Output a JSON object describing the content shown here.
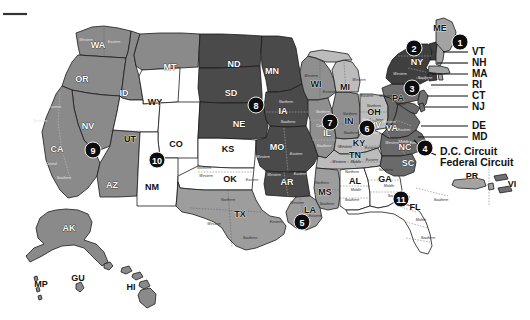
{
  "figure": {
    "type": "choropleth-map"
  },
  "circuits": [
    {
      "number": "1",
      "badge": {
        "x": 460,
        "y": 42
      },
      "fill": "#a3a3a3",
      "states": [
        "ME",
        "NH",
        "MA",
        "RI",
        "PR"
      ]
    },
    {
      "number": "2",
      "badge": {
        "x": 414,
        "y": 48
      },
      "fill": "#3f3f3f",
      "states": [
        "NY",
        "VT",
        "CT"
      ]
    },
    {
      "number": "3",
      "badge": {
        "x": 412,
        "y": 88
      },
      "fill": "#707070",
      "states": [
        "PA",
        "NJ",
        "DE",
        "VI"
      ]
    },
    {
      "number": "4",
      "badge": {
        "x": 425,
        "y": 148
      },
      "fill": "#6a6a6a",
      "states": [
        "MD",
        "VA",
        "WV",
        "NC",
        "SC"
      ]
    },
    {
      "number": "5",
      "badge": {
        "x": 302,
        "y": 222
      },
      "fill": "#9d9d9d",
      "states": [
        "TX",
        "LA",
        "MS"
      ]
    },
    {
      "number": "6",
      "badge": {
        "x": 367,
        "y": 128
      },
      "fill": "#bcbcbc",
      "states": [
        "MI",
        "OH",
        "KY",
        "TN"
      ]
    },
    {
      "number": "7",
      "badge": {
        "x": 330,
        "y": 122
      },
      "fill": "#8f8f8f",
      "states": [
        "WI",
        "IL",
        "IN"
      ]
    },
    {
      "number": "8",
      "badge": {
        "x": 256,
        "y": 105
      },
      "fill": "#4a4a4a",
      "states": [
        "ND",
        "SD",
        "NE",
        "MN",
        "IA",
        "MO",
        "AR"
      ]
    },
    {
      "number": "9",
      "badge": {
        "x": 93,
        "y": 150
      },
      "fill": "#8a8a8a",
      "states": [
        "CA",
        "NV",
        "OR",
        "WA",
        "ID",
        "MT",
        "AZ",
        "AK",
        "HI",
        "GU",
        "MP"
      ]
    },
    {
      "number": "10",
      "badge": {
        "x": 157,
        "y": 160
      },
      "fill": "#ffffff",
      "states": [
        "CO",
        "KS",
        "NM",
        "OK",
        "UT",
        "WY"
      ]
    },
    {
      "number": "11",
      "badge": {
        "x": 401,
        "y": 199
      },
      "fill": "#ffffff",
      "states": [
        "AL",
        "GA",
        "FL"
      ]
    }
  ],
  "state_labels": [
    {
      "abbr": "WA",
      "x": 98,
      "y": 46,
      "tone": "ondark"
    },
    {
      "abbr": "OR",
      "x": 82,
      "y": 80,
      "tone": "ondark"
    },
    {
      "abbr": "ID",
      "x": 124,
      "y": 94,
      "tone": "ondark"
    },
    {
      "abbr": "MT",
      "x": 170,
      "y": 68,
      "tone": "ondark"
    },
    {
      "abbr": "ND",
      "x": 234,
      "y": 65,
      "tone": "ondark"
    },
    {
      "abbr": "SD",
      "x": 231,
      "y": 94,
      "tone": "ondark"
    },
    {
      "abbr": "NE",
      "x": 239,
      "y": 125,
      "tone": "ondark"
    },
    {
      "abbr": "MN",
      "x": 272,
      "y": 72,
      "tone": "ondark"
    },
    {
      "abbr": "IA",
      "x": 283,
      "y": 112,
      "tone": "ondark"
    },
    {
      "abbr": "MO",
      "x": 277,
      "y": 148,
      "tone": "ondark"
    },
    {
      "abbr": "AR",
      "x": 287,
      "y": 183,
      "tone": "ondark"
    },
    {
      "abbr": "WY",
      "x": 155,
      "y": 103,
      "tone": "onlight"
    },
    {
      "abbr": "UT",
      "x": 130,
      "y": 140,
      "tone": "onlight"
    },
    {
      "abbr": "CO",
      "x": 176,
      "y": 145,
      "tone": "onlight"
    },
    {
      "abbr": "KS",
      "x": 228,
      "y": 150,
      "tone": "onlight"
    },
    {
      "abbr": "OK",
      "x": 230,
      "y": 180,
      "tone": "onlight"
    },
    {
      "abbr": "NM",
      "x": 152,
      "y": 188,
      "tone": "onlight"
    },
    {
      "abbr": "AZ",
      "x": 112,
      "y": 186,
      "tone": "ondark"
    },
    {
      "abbr": "NV",
      "x": 88,
      "y": 127,
      "tone": "ondark"
    },
    {
      "abbr": "CA",
      "x": 57,
      "y": 150,
      "tone": "ondark"
    },
    {
      "abbr": "TX",
      "x": 240,
      "y": 215,
      "tone": "onlight"
    },
    {
      "abbr": "LA",
      "x": 310,
      "y": 211,
      "tone": "onlight"
    },
    {
      "abbr": "MS",
      "x": 325,
      "y": 193,
      "tone": "onlight"
    },
    {
      "abbr": "AL",
      "x": 355,
      "y": 182,
      "tone": "onlight"
    },
    {
      "abbr": "GA",
      "x": 385,
      "y": 180,
      "tone": "onlight"
    },
    {
      "abbr": "FL",
      "x": 415,
      "y": 208,
      "tone": "onlight"
    },
    {
      "abbr": "SC",
      "x": 408,
      "y": 164,
      "tone": "ondark"
    },
    {
      "abbr": "NC",
      "x": 405,
      "y": 148,
      "tone": "ondark"
    },
    {
      "abbr": "VA",
      "x": 392,
      "y": 129,
      "tone": "ondark"
    },
    {
      "abbr": "WV",
      "x": 374,
      "y": 126,
      "tone": "ondark"
    },
    {
      "abbr": "TN",
      "x": 355,
      "y": 156,
      "tone": "onlight"
    },
    {
      "abbr": "KY",
      "x": 359,
      "y": 144,
      "tone": "onlight"
    },
    {
      "abbr": "OH",
      "x": 374,
      "y": 113,
      "tone": "onlight"
    },
    {
      "abbr": "IN",
      "x": 349,
      "y": 122,
      "tone": "onlight"
    },
    {
      "abbr": "IL",
      "x": 327,
      "y": 134,
      "tone": "ondark"
    },
    {
      "abbr": "MI",
      "x": 345,
      "y": 88,
      "tone": "onlight"
    },
    {
      "abbr": "WI",
      "x": 316,
      "y": 85,
      "tone": "onlight"
    },
    {
      "abbr": "PA",
      "x": 398,
      "y": 99,
      "tone": "onlight"
    },
    {
      "abbr": "NY",
      "x": 417,
      "y": 63,
      "tone": "ondark"
    },
    {
      "abbr": "ME",
      "x": 440,
      "y": 29,
      "tone": "onlight"
    },
    {
      "abbr": "AK",
      "x": 69,
      "y": 229,
      "tone": "ondark"
    },
    {
      "abbr": "HI",
      "x": 131,
      "y": 288,
      "tone": "onlight"
    },
    {
      "abbr": "GU",
      "x": 78,
      "y": 279,
      "tone": "onlight"
    },
    {
      "abbr": "MP",
      "x": 41,
      "y": 285,
      "tone": "onlight"
    },
    {
      "abbr": "PR",
      "x": 472,
      "y": 177,
      "tone": "onlight"
    },
    {
      "abbr": "VI",
      "x": 512,
      "y": 185,
      "tone": "onlight"
    }
  ],
  "side_labels": [
    {
      "text": "VT",
      "x": 472,
      "y": 52,
      "leader_to_x": 443,
      "leader_to_y": 52
    },
    {
      "text": "NH",
      "x": 472,
      "y": 63,
      "leader_to_x": 437,
      "leader_to_y": 63
    },
    {
      "text": "MA",
      "x": 472,
      "y": 74,
      "leader_to_x": 432,
      "leader_to_y": 74
    },
    {
      "text": "RI",
      "x": 472,
      "y": 85,
      "leader_to_x": 431,
      "leader_to_y": 85
    },
    {
      "text": "CT",
      "x": 472,
      "y": 96,
      "leader_to_x": 427,
      "leader_to_y": 96
    },
    {
      "text": "NJ",
      "x": 472,
      "y": 107,
      "leader_to_x": 424,
      "leader_to_y": 107
    },
    {
      "text": "DE",
      "x": 472,
      "y": 126,
      "leader_to_x": 421,
      "leader_to_y": 126
    },
    {
      "text": "MD",
      "x": 472,
      "y": 137,
      "leader_to_x": 418,
      "leader_to_y": 137
    }
  ],
  "circuit_labels": [
    {
      "text": "D.C. Circuit",
      "x": 440,
      "y": 152
    },
    {
      "text": "Federal Circuit",
      "x": 440,
      "y": 163
    }
  ],
  "district_labels": [
    {
      "text": "Western",
      "x": 86,
      "y": 40,
      "tone": "ondark"
    },
    {
      "text": "Eastern",
      "x": 114,
      "y": 42,
      "tone": "ondark"
    },
    {
      "text": "Eastern",
      "x": 55,
      "y": 107,
      "tone": "ondark"
    },
    {
      "text": "Northern",
      "x": 40,
      "y": 121,
      "tone": "ondark"
    },
    {
      "text": "Central",
      "x": 51,
      "y": 164,
      "tone": "ondark"
    },
    {
      "text": "Southern",
      "x": 64,
      "y": 178,
      "tone": "ondark"
    },
    {
      "text": "Northern",
      "x": 286,
      "y": 102,
      "tone": "ondark"
    },
    {
      "text": "Southern",
      "x": 288,
      "y": 122,
      "tone": "ondark"
    },
    {
      "text": "Western",
      "x": 263,
      "y": 157,
      "tone": "ondark"
    },
    {
      "text": "Eastern",
      "x": 296,
      "y": 154,
      "tone": "ondark"
    },
    {
      "text": "Western",
      "x": 274,
      "y": 175,
      "tone": "ondark"
    },
    {
      "text": "Eastern",
      "x": 300,
      "y": 174,
      "tone": "ondark"
    },
    {
      "text": "Northern",
      "x": 204,
      "y": 168,
      "tone": "onlight"
    },
    {
      "text": "Western",
      "x": 206,
      "y": 176,
      "tone": "onlight"
    },
    {
      "text": "Eastern",
      "x": 252,
      "y": 180,
      "tone": "onlight"
    },
    {
      "text": "Northern",
      "x": 228,
      "y": 200,
      "tone": "onlight"
    },
    {
      "text": "Western",
      "x": 214,
      "y": 224,
      "tone": "onlight"
    },
    {
      "text": "Eastern",
      "x": 276,
      "y": 222,
      "tone": "onlight"
    },
    {
      "text": "Southern",
      "x": 250,
      "y": 238,
      "tone": "onlight"
    },
    {
      "text": "Western",
      "x": 297,
      "y": 203,
      "tone": "onlight"
    },
    {
      "text": "Eastern",
      "x": 315,
      "y": 216,
      "tone": "onlight"
    },
    {
      "text": "Northern",
      "x": 322,
      "y": 183,
      "tone": "onlight"
    },
    {
      "text": "Southern",
      "x": 327,
      "y": 204,
      "tone": "onlight"
    },
    {
      "text": "Northern",
      "x": 352,
      "y": 172,
      "tone": "onlight"
    },
    {
      "text": "Middle",
      "x": 356,
      "y": 190,
      "tone": "onlight"
    },
    {
      "text": "Southern",
      "x": 352,
      "y": 200,
      "tone": "onlight"
    },
    {
      "text": "Northern",
      "x": 386,
      "y": 170,
      "tone": "onlight"
    },
    {
      "text": "Middle",
      "x": 389,
      "y": 186,
      "tone": "onlight"
    },
    {
      "text": "Southern",
      "x": 395,
      "y": 196,
      "tone": "onlight"
    },
    {
      "text": "Northern",
      "x": 403,
      "y": 197,
      "tone": "onlight"
    },
    {
      "text": "Middle",
      "x": 421,
      "y": 220,
      "tone": "onlight"
    },
    {
      "text": "Southern",
      "x": 428,
      "y": 238,
      "tone": "onlight"
    },
    {
      "text": "Western",
      "x": 311,
      "y": 76,
      "tone": "onlight"
    },
    {
      "text": "Eastern",
      "x": 329,
      "y": 92,
      "tone": "onlight"
    },
    {
      "text": "Western",
      "x": 359,
      "y": 80,
      "tone": "onlight"
    },
    {
      "text": "Eastern",
      "x": 367,
      "y": 96,
      "tone": "onlight"
    },
    {
      "text": "Northern",
      "x": 323,
      "y": 112,
      "tone": "ondark"
    },
    {
      "text": "Central",
      "x": 322,
      "y": 126,
      "tone": "ondark"
    },
    {
      "text": "Southern",
      "x": 324,
      "y": 146,
      "tone": "ondark"
    },
    {
      "text": "Northern",
      "x": 350,
      "y": 114,
      "tone": "onlight"
    },
    {
      "text": "Southern",
      "x": 351,
      "y": 133,
      "tone": "onlight"
    },
    {
      "text": "Northern",
      "x": 374,
      "y": 106,
      "tone": "onlight"
    },
    {
      "text": "Southern",
      "x": 376,
      "y": 120,
      "tone": "onlight"
    },
    {
      "text": "Western",
      "x": 345,
      "y": 147,
      "tone": "onlight"
    },
    {
      "text": "Eastern",
      "x": 371,
      "y": 148,
      "tone": "onlight"
    },
    {
      "text": "Western",
      "x": 339,
      "y": 162,
      "tone": "onlight"
    },
    {
      "text": "Middle",
      "x": 356,
      "y": 162,
      "tone": "onlight"
    },
    {
      "text": "Eastern",
      "x": 372,
      "y": 160,
      "tone": "onlight"
    },
    {
      "text": "Northern",
      "x": 369,
      "y": 120,
      "tone": "ondark"
    },
    {
      "text": "Southern",
      "x": 372,
      "y": 133,
      "tone": "ondark"
    },
    {
      "text": "Western",
      "x": 389,
      "y": 122,
      "tone": "ondark"
    },
    {
      "text": "Eastern",
      "x": 404,
      "y": 130,
      "tone": "ondark"
    },
    {
      "text": "Western",
      "x": 392,
      "y": 143,
      "tone": "ondark"
    },
    {
      "text": "Middle",
      "x": 404,
      "y": 142,
      "tone": "ondark"
    },
    {
      "text": "Eastern",
      "x": 416,
      "y": 143,
      "tone": "ondark"
    },
    {
      "text": "Northern",
      "x": 415,
      "y": 50,
      "tone": "ondark"
    },
    {
      "text": "Western",
      "x": 400,
      "y": 74,
      "tone": "ondark"
    },
    {
      "text": "Southern",
      "x": 425,
      "y": 78,
      "tone": "ondark"
    },
    {
      "text": "Eastern",
      "x": 432,
      "y": 88,
      "tone": "ondark"
    },
    {
      "text": "Western",
      "x": 386,
      "y": 96,
      "tone": "onlight"
    },
    {
      "text": "Middle",
      "x": 401,
      "y": 104,
      "tone": "onlight"
    },
    {
      "text": "Southern",
      "x": 441,
      "y": 200,
      "tone": "onlight"
    }
  ],
  "corner_tick": {
    "x1": 3,
    "y1": 14,
    "x2": 27,
    "y2": 14
  }
}
